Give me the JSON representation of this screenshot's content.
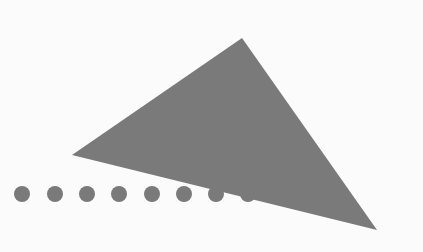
{
  "diagram": {
    "background": "#fbfbfb",
    "fill_color": "#7a7a7a",
    "triangle": {
      "points": [
        [
          242,
          38
        ],
        [
          72,
          155
        ],
        [
          377,
          230
        ]
      ]
    },
    "dots": {
      "count": 8,
      "y": 194,
      "radius": 8,
      "x": [
        22,
        55,
        87,
        119,
        152,
        184,
        216,
        248
      ]
    }
  }
}
